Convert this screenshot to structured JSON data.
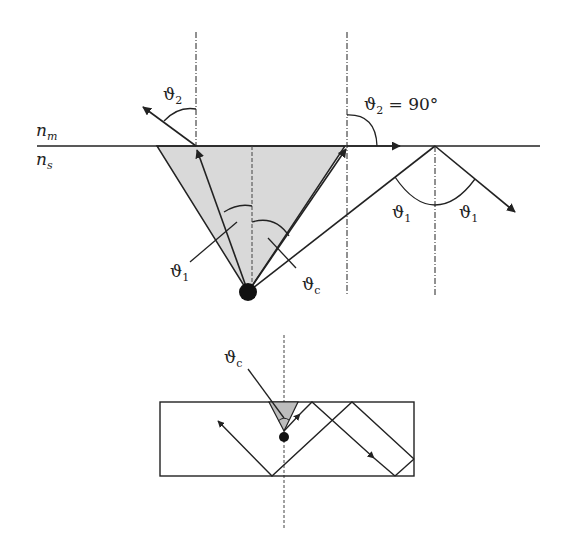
{
  "diagram": {
    "media": {
      "upper": {
        "symbol": "n",
        "subscript": "m"
      },
      "lower": {
        "symbol": "n",
        "subscript": "s"
      }
    },
    "labels": {
      "theta2_left": {
        "symbol": "ϑ",
        "subscript": "2"
      },
      "theta2_90": {
        "symbol": "ϑ",
        "subscript": "2",
        "suffix": " = 90°"
      },
      "theta1_left": {
        "symbol": "ϑ",
        "subscript": "1"
      },
      "theta_c_top": {
        "symbol": "ϑ",
        "subscript": "c"
      },
      "theta1_refl_left": {
        "symbol": "ϑ",
        "subscript": "1"
      },
      "theta1_refl_right": {
        "symbol": "ϑ",
        "subscript": "1"
      },
      "theta_c_bottom": {
        "symbol": "ϑ",
        "subscript": "c"
      }
    },
    "colors": {
      "line": "#222222",
      "cone_fill": "#d9d9d9",
      "small_cone_fill": "#bdbdbd",
      "background": "#ffffff"
    }
  }
}
